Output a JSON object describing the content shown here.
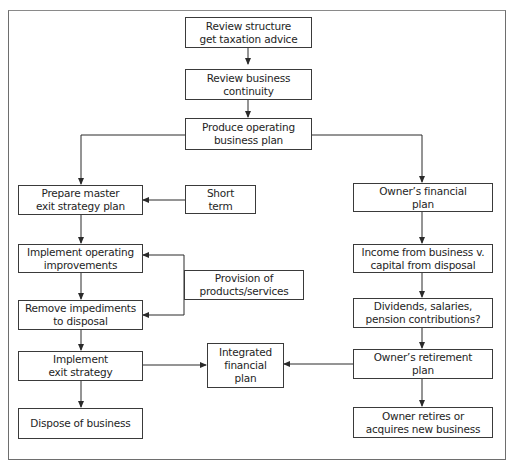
{
  "diagram": {
    "type": "flowchart",
    "nodes": {
      "review_structure": {
        "label": "Review structure\nget taxation advice"
      },
      "review_continuity": {
        "label": "Review business\ncontinuity"
      },
      "operating_plan": {
        "label": "Produce operating\nbusiness plan"
      },
      "master_exit_plan": {
        "label": "Prepare master\nexit strategy plan"
      },
      "short_term": {
        "label": "Short\nterm"
      },
      "operating_improvements": {
        "label": "Implement operating\nimprovements"
      },
      "provision_products": {
        "label": "Provision of\nproducts/services"
      },
      "remove_impediments": {
        "label": "Remove impediments\nto disposal"
      },
      "implement_exit": {
        "label": "Implement\nexit strategy"
      },
      "integrated_plan": {
        "label": "Integrated\nfinancial\nplan"
      },
      "dispose_business": {
        "label": "Dispose of business"
      },
      "owners_financial_plan": {
        "label": "Owner’s financial\nplan"
      },
      "income_vs_capital": {
        "label": "Income from business v.\ncapital from disposal"
      },
      "dividends_salaries": {
        "label": "Dividends, salaries,\npension contributions?"
      },
      "owners_retirement_plan": {
        "label": "Owner’s retirement\nplan"
      },
      "owner_retires": {
        "label": "Owner retires or\nacquires new business"
      }
    },
    "edges": [
      {
        "from": "review_structure",
        "to": "review_continuity"
      },
      {
        "from": "review_continuity",
        "to": "operating_plan"
      },
      {
        "from": "operating_plan",
        "to": "master_exit_plan"
      },
      {
        "from": "operating_plan",
        "to": "owners_financial_plan"
      },
      {
        "from": "short_term",
        "to": "master_exit_plan"
      },
      {
        "from": "master_exit_plan",
        "to": "operating_improvements"
      },
      {
        "from": "provision_products",
        "to": "operating_improvements"
      },
      {
        "from": "provision_products",
        "to": "remove_impediments"
      },
      {
        "from": "operating_improvements",
        "to": "remove_impediments"
      },
      {
        "from": "remove_impediments",
        "to": "implement_exit"
      },
      {
        "from": "implement_exit",
        "to": "dispose_business"
      },
      {
        "from": "implement_exit",
        "to": "integrated_plan"
      },
      {
        "from": "owners_financial_plan",
        "to": "income_vs_capital"
      },
      {
        "from": "income_vs_capital",
        "to": "dividends_salaries"
      },
      {
        "from": "dividends_salaries",
        "to": "owners_retirement_plan"
      },
      {
        "from": "owners_retirement_plan",
        "to": "integrated_plan"
      },
      {
        "from": "owners_retirement_plan",
        "to": "owner_retires"
      }
    ],
    "colors": {
      "line": "#2a2a2a",
      "border": "#3a3a3a",
      "text": "#1e1e1e",
      "background": "#ffffff"
    }
  }
}
